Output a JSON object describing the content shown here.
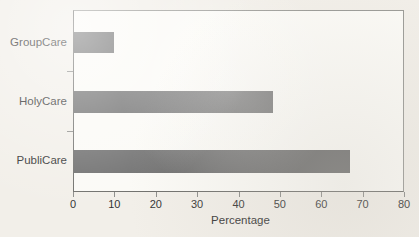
{
  "chart_data": {
    "type": "bar",
    "orientation": "horizontal",
    "title": "",
    "subtitle": "",
    "xlabel": "Percentage",
    "ylabel": "",
    "categories": [
      "PubliCare",
      "HolyCare",
      "GroupCare"
    ],
    "values": [
      66.7,
      48.0,
      9.7
    ],
    "series": [
      {
        "name": "Percentage",
        "values": [
          66.7,
          48.0,
          9.7
        ]
      }
    ],
    "xlim": [
      0,
      80
    ],
    "xticks": [
      0,
      10,
      20,
      30,
      40,
      50,
      60,
      70,
      80
    ],
    "xticklabels": [
      "0",
      "10",
      "20",
      "30",
      "40",
      "50",
      "60",
      "70",
      "80"
    ],
    "yticklabels": [
      "GroupCare",
      "HolyCare",
      "PubliCare"
    ],
    "grid": false,
    "legend": false,
    "legend_position": "none",
    "bar_color": "#6e6e6e",
    "plot_background": "#fbfaf6",
    "figure_background": "#f2efe9",
    "axis_color": "#6f6f6c",
    "text_color": "#333333"
  },
  "axis": {
    "x_label": "Percentage"
  },
  "y_categories": [
    {
      "label": "GroupCare",
      "value": 9.7
    },
    {
      "label": "HolyCare",
      "value": 48.0
    },
    {
      "label": "PubliCare",
      "value": 66.7
    }
  ],
  "x_ticks": [
    {
      "label": "0",
      "value": 0
    },
    {
      "label": "10",
      "value": 10
    },
    {
      "label": "20",
      "value": 20
    },
    {
      "label": "30",
      "value": 30
    },
    {
      "label": "40",
      "value": 40
    },
    {
      "label": "50",
      "value": 50
    },
    {
      "label": "60",
      "value": 60
    },
    {
      "label": "70",
      "value": 70
    },
    {
      "label": "80",
      "value": 80
    }
  ]
}
